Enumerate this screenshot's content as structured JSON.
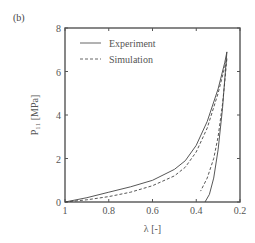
{
  "panel_label": "(b)",
  "chart_data": {
    "type": "line",
    "title": "",
    "xlabel": "λ [-]",
    "ylabel": "P₁₁ [MPa]",
    "xlim": [
      1,
      0.2
    ],
    "ylim": [
      0,
      8
    ],
    "x_reversed": true,
    "xticks": [
      1,
      0.8,
      0.6,
      0.4,
      0.2
    ],
    "xtick_labels": [
      "1",
      "0.8",
      "0.6",
      "0.4",
      "0.2"
    ],
    "yticks": [
      0,
      2,
      4,
      6,
      8
    ],
    "ytick_labels": [
      "0",
      "2",
      "4",
      "6",
      "8"
    ],
    "grid": false,
    "legend_position": "upper left",
    "legend": [
      {
        "label": "Experiment",
        "style": "solid"
      },
      {
        "label": "Simulation",
        "style": "dashed"
      }
    ],
    "series": [
      {
        "name": "Experiment",
        "style": "solid",
        "segment": "loading",
        "x": [
          1.0,
          0.9,
          0.8,
          0.7,
          0.6,
          0.5,
          0.45,
          0.4,
          0.35,
          0.3,
          0.27,
          0.26
        ],
        "y": [
          0.0,
          0.2,
          0.45,
          0.7,
          1.0,
          1.5,
          1.9,
          2.6,
          3.7,
          5.2,
          6.4,
          6.9
        ]
      },
      {
        "name": "Experiment",
        "style": "solid",
        "segment": "unloading",
        "x": [
          0.26,
          0.27,
          0.28,
          0.3,
          0.32,
          0.34,
          0.36
        ],
        "y": [
          6.9,
          5.6,
          4.3,
          2.4,
          1.1,
          0.35,
          0.0
        ]
      },
      {
        "name": "Simulation",
        "style": "dashed",
        "segment": "loading",
        "x": [
          1.0,
          0.9,
          0.8,
          0.7,
          0.6,
          0.5,
          0.45,
          0.4,
          0.35,
          0.3,
          0.27,
          0.26
        ],
        "y": [
          0.0,
          0.1,
          0.25,
          0.45,
          0.75,
          1.2,
          1.6,
          2.3,
          3.4,
          5.0,
          6.2,
          6.6
        ]
      },
      {
        "name": "Simulation",
        "style": "dashed",
        "segment": "unloading",
        "x": [
          0.26,
          0.27,
          0.28,
          0.3,
          0.32,
          0.35,
          0.38
        ],
        "y": [
          6.6,
          5.5,
          4.5,
          3.0,
          2.0,
          1.1,
          0.5
        ]
      }
    ]
  }
}
